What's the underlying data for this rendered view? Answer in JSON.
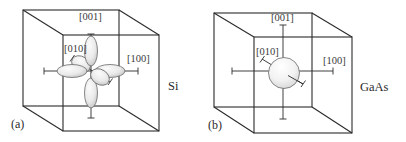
{
  "figure": {
    "panels": [
      {
        "id": "a",
        "panel_label": "(a)",
        "material": "Si",
        "surface_type": "ellipsoids",
        "valley_count": 6,
        "axis_labels": {
          "z": "[001]",
          "y": "[010]",
          "x": "[100]"
        }
      },
      {
        "id": "b",
        "panel_label": "(b)",
        "material": "GaAs",
        "surface_type": "sphere",
        "valley_count": 1,
        "axis_labels": {
          "z": "[001]",
          "y": "[010]",
          "x": "[100]"
        }
      }
    ],
    "colors": {
      "line": "#2a2a2a",
      "surface_fill_light": "#f4f4f4",
      "surface_fill_dark": "#c8c8c8",
      "text": "#3a3a3a"
    }
  }
}
